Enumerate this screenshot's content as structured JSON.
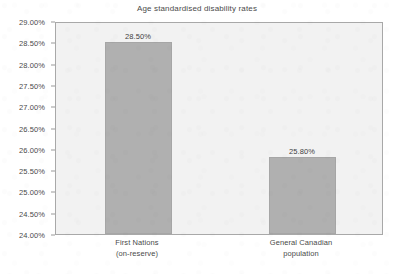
{
  "chart_data": {
    "type": "bar",
    "title": "Age standardised disability rates",
    "xlabel": "",
    "ylabel": "",
    "categories": [
      "First Nations\n(on-reserve)",
      "General Canadian\npopulation"
    ],
    "category_lines": [
      [
        "First Nations",
        "(on-reserve)"
      ],
      [
        "General Canadian",
        "population"
      ]
    ],
    "values": [
      28.5,
      25.8
    ],
    "value_labels": [
      "28.50%",
      "25.80%"
    ],
    "ylim": [
      24.0,
      29.0
    ],
    "ytick_step": 0.5,
    "ytick_labels": [
      "29.00%",
      "28.50%",
      "28.00%",
      "27.50%",
      "27.00%",
      "26.50%",
      "26.00%",
      "25.50%",
      "25.00%",
      "24.50%",
      "24.00%"
    ],
    "ytick_values": [
      29.0,
      28.5,
      28.0,
      27.5,
      27.0,
      26.5,
      26.0,
      25.5,
      25.0,
      24.5,
      24.0
    ],
    "grid": false,
    "legend": false,
    "legend_position": "none",
    "bar_color": "#b0b0b0",
    "plot_background": "#f2f2f2",
    "frame_color": "#a8a8a8",
    "text_color": "#4a4a4a"
  }
}
